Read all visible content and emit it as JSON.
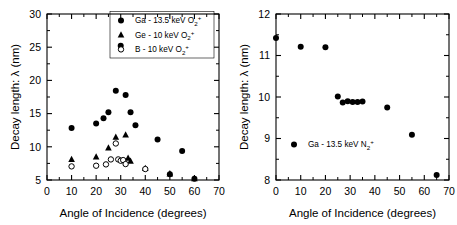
{
  "figure": {
    "panels": [
      "left",
      "right"
    ],
    "background_color": "#ffffff",
    "marker_color": "#000000"
  },
  "chart_data": [
    {
      "id": "left",
      "type": "scatter",
      "title": "",
      "xlabel": "Angle of Incidence (degrees)",
      "ylabel": "Decay length: λ (nm)",
      "xlim": [
        0,
        70
      ],
      "ylim": [
        5,
        30
      ],
      "xticks": [
        0,
        10,
        20,
        30,
        40,
        50,
        60,
        70
      ],
      "yticks": [
        5,
        10,
        15,
        20,
        25,
        30
      ],
      "xtick_labels": [
        "0",
        "10",
        "20",
        "30",
        "40",
        "50",
        "60",
        "70"
      ],
      "ytick_labels": [
        "5",
        "10",
        "15",
        "20",
        "25",
        "30"
      ],
      "minor_xticks": [
        5,
        15,
        25,
        35,
        45,
        55,
        65
      ],
      "minor_yticks": [
        7.5,
        12.5,
        17.5,
        22.5,
        27.5
      ],
      "grid": false,
      "legend_position": "top-right",
      "series": [
        {
          "name": "Ga - 13.5 keV O2+",
          "label_parts": {
            "element": "Ga - 13.5 keV O",
            "sub": "2",
            "sup": "+"
          },
          "marker": "filled-circle",
          "color": "#000000",
          "points": [
            [
              10,
              12.85
            ],
            [
              20,
              13.5
            ],
            [
              23,
              14.3
            ],
            [
              25,
              15.2
            ],
            [
              28,
              18.45
            ],
            [
              30,
              25.2
            ],
            [
              32,
              17.8
            ],
            [
              34,
              15.2
            ],
            [
              36,
              13.25
            ],
            [
              45,
              11.1
            ],
            [
              50,
              5.85
            ],
            [
              55,
              9.35
            ],
            [
              60,
              5.2
            ]
          ]
        },
        {
          "name": "Ge - 10 keV O2+",
          "label_parts": {
            "element": "Ge - 10 keV O",
            "sub": "2",
            "sup": "+"
          },
          "marker": "filled-triangle",
          "color": "#000000",
          "points": [
            [
              10,
              8.1
            ],
            [
              20,
              8.5
            ],
            [
              25,
              9.85
            ],
            [
              28,
              11.45
            ],
            [
              32,
              11.8
            ],
            [
              33,
              8.3
            ],
            [
              34,
              7.85
            ],
            [
              40,
              6.75
            ],
            [
              50,
              5.95
            ],
            [
              60,
              5.2
            ]
          ]
        },
        {
          "name": "B - 10 keV O2+",
          "label_parts": {
            "element": "B - 10 keV O",
            "sub": "2",
            "sup": "+"
          },
          "marker": "open-circle",
          "color": "#000000",
          "points": [
            [
              10,
              7.05
            ],
            [
              20,
              7.15
            ],
            [
              24,
              7.35
            ],
            [
              26,
              8.1
            ],
            [
              28,
              10.5
            ],
            [
              29,
              8.1
            ],
            [
              30,
              7.9
            ],
            [
              31,
              8.0
            ],
            [
              32,
              7.4
            ],
            [
              40,
              6.65
            ]
          ]
        }
      ]
    },
    {
      "id": "right",
      "type": "scatter",
      "title": "",
      "xlabel": "Angle of Incidence (degrees)",
      "ylabel": "Decay length: λ (nm)",
      "xlim": [
        0,
        70
      ],
      "ylim": [
        8,
        12
      ],
      "xticks": [
        0,
        10,
        20,
        30,
        40,
        50,
        60,
        70
      ],
      "yticks": [
        8,
        9,
        10,
        11,
        12
      ],
      "xtick_labels": [
        "0",
        "10",
        "20",
        "30",
        "40",
        "50",
        "60",
        "70"
      ],
      "ytick_labels": [
        "8",
        "9",
        "10",
        "11",
        "12"
      ],
      "minor_xticks": [
        5,
        15,
        25,
        35,
        45,
        55,
        65
      ],
      "minor_yticks": [
        8.5,
        9.5,
        10.5,
        11.5
      ],
      "grid": false,
      "legend_position": "bottom-left",
      "series": [
        {
          "name": "Ga - 13.5 keV N2+",
          "label_parts": {
            "element": "Ga - 13.5 keV N",
            "sub": "2",
            "sup": "+"
          },
          "marker": "filled-circle",
          "color": "#000000",
          "points": [
            [
              0,
              11.42
            ],
            [
              10,
              11.21
            ],
            [
              20,
              11.2
            ],
            [
              25,
              10.01
            ],
            [
              27,
              9.87
            ],
            [
              29,
              9.9
            ],
            [
              31,
              9.88
            ],
            [
              33,
              9.88
            ],
            [
              35,
              9.89
            ],
            [
              45,
              9.75
            ],
            [
              55,
              9.09
            ],
            [
              65,
              8.12
            ]
          ]
        }
      ]
    }
  ]
}
